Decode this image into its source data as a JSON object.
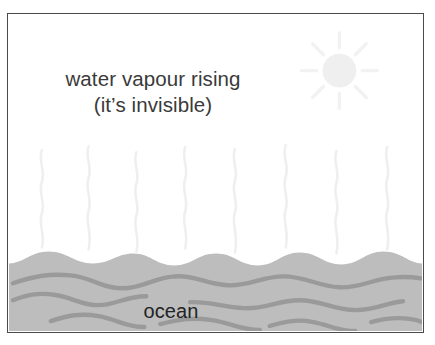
{
  "diagram": {
    "title_lines": [
      "water vapour rising",
      "(it’s invisible)"
    ],
    "ocean_label": "ocean",
    "colors": {
      "frame_border": "#4a4a4a",
      "background": "#ffffff",
      "ocean_fill": "#bdbdbd",
      "ocean_wave_line": "#9a9a9a",
      "vapour_line": "#f0f0f0",
      "sun_disc": "#efefef",
      "sun_ray": "#f2f2f2",
      "caption_text": "#3a3a3a",
      "ocean_text": "#232323"
    },
    "sun": {
      "name": "sun",
      "center_x": 340,
      "center_y": 70,
      "disc_radius": 17,
      "ray_count": 8,
      "ray_inner_radius": 23,
      "ray_outer_radius": 38
    },
    "ocean": {
      "name": "ocean-water",
      "surface_top_y": 252,
      "surface_trough_y": 264,
      "wave_line_count": 8
    },
    "vapour": {
      "name": "water-vapour",
      "squiggle_count": 8,
      "top_y": 145,
      "bottom_y": 256
    }
  }
}
